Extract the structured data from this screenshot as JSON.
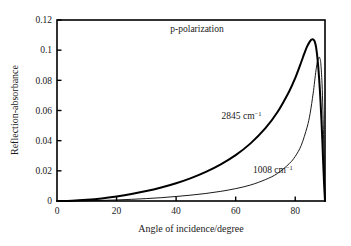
{
  "chart_data": {
    "type": "line",
    "title": "",
    "annotation": "p-polarization",
    "xlabel": "Angle of incidence/degree",
    "ylabel": "Reflection-absorbance",
    "xlim": [
      0,
      90
    ],
    "ylim": [
      0,
      0.12
    ],
    "xticks": [
      0,
      20,
      40,
      60,
      80
    ],
    "xtick_labels": [
      "0",
      "20",
      "40",
      "60",
      "80"
    ],
    "yticks": [
      0,
      0.02,
      0.04,
      0.06,
      0.08,
      0.1,
      0.12
    ],
    "ytick_labels": [
      "0",
      "0.02",
      "0.04",
      "0.06",
      "0.08",
      "0.1",
      "0.12"
    ],
    "grid": false,
    "legend_position": "inline-curve-labels",
    "series": [
      {
        "name": "2845 cm-1",
        "label_text": "2845 cm",
        "label_sup": "−1",
        "label_x": 62,
        "label_y": 0.0545,
        "stroke_width": 2.0,
        "color": "#000000",
        "peak_x": 86,
        "peak_y": 0.107,
        "x": [
          0,
          5,
          10,
          15,
          20,
          25,
          30,
          35,
          40,
          45,
          50,
          55,
          60,
          65,
          70,
          74,
          78,
          80,
          82,
          83,
          84,
          85,
          85.5,
          86,
          86.5,
          87,
          87.5,
          88,
          88.5,
          89,
          89.4,
          89.7,
          90
        ],
        "y": [
          0,
          0.0002,
          0.0008,
          0.0017,
          0.003,
          0.0046,
          0.0066,
          0.009,
          0.0118,
          0.0152,
          0.0193,
          0.0243,
          0.0304,
          0.0382,
          0.0483,
          0.0588,
          0.0728,
          0.0815,
          0.092,
          0.0975,
          0.1025,
          0.106,
          0.107,
          0.1072,
          0.106,
          0.102,
          0.094,
          0.082,
          0.066,
          0.045,
          0.025,
          0.011,
          0
        ]
      },
      {
        "name": "1008 cm-1",
        "label_text": "1008 cm",
        "label_sup": "−1",
        "label_x": 72.5,
        "label_y": 0.0185,
        "stroke_width": 0.9,
        "color": "#000000",
        "peak_x": 88,
        "peak_y": 0.095,
        "x": [
          0,
          5,
          10,
          15,
          20,
          25,
          30,
          35,
          40,
          45,
          50,
          55,
          60,
          65,
          70,
          74,
          78,
          80,
          82,
          84,
          85,
          86,
          86.5,
          87,
          87.5,
          88,
          88.3,
          88.6,
          89,
          89.3,
          89.6,
          89.8,
          90
        ],
        "y": [
          0,
          4e-05,
          0.00018,
          0.0004,
          0.0007,
          0.0011,
          0.0016,
          0.0022,
          0.003,
          0.0039,
          0.005,
          0.0064,
          0.0082,
          0.0106,
          0.0142,
          0.0182,
          0.0248,
          0.0296,
          0.0368,
          0.049,
          0.058,
          0.071,
          0.079,
          0.087,
          0.093,
          0.0952,
          0.0945,
          0.091,
          0.078,
          0.06,
          0.035,
          0.018,
          0
        ]
      }
    ]
  },
  "axes_geometry": {
    "left_px": 57,
    "right_px": 325,
    "top_px": 20,
    "bottom_px": 201,
    "frame_color": "#000000"
  }
}
